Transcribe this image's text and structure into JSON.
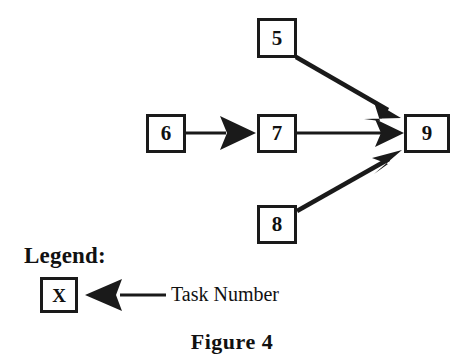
{
  "figure": {
    "caption": "Figure  4",
    "background_color": "#ffffff",
    "ink_color": "#1a1a1a"
  },
  "diagram": {
    "nodes": [
      {
        "id": "node-5",
        "label": "5",
        "x": 257,
        "y": 18,
        "w": 40,
        "h": 40
      },
      {
        "id": "node-6",
        "label": "6",
        "x": 146,
        "y": 114,
        "w": 40,
        "h": 39
      },
      {
        "id": "node-7",
        "label": "7",
        "x": 257,
        "y": 114,
        "w": 40,
        "h": 39
      },
      {
        "id": "node-8",
        "label": "8",
        "x": 257,
        "y": 205,
        "w": 40,
        "h": 39
      },
      {
        "id": "node-9",
        "label": "9",
        "x": 404,
        "y": 114,
        "w": 46,
        "h": 39
      }
    ],
    "edges": [
      {
        "id": "edge-5-9",
        "from": "5",
        "to": "9",
        "x1": 296,
        "y1": 57,
        "x2": 400,
        "y2": 117
      },
      {
        "id": "edge-6-7",
        "from": "6",
        "to": "7",
        "x1": 186,
        "y1": 133,
        "x2": 256,
        "y2": 133
      },
      {
        "id": "edge-7-9",
        "from": "7",
        "to": "9",
        "x1": 297,
        "y1": 133,
        "x2": 403,
        "y2": 133
      },
      {
        "id": "edge-8-9",
        "from": "8",
        "to": "9",
        "x1": 297,
        "y1": 211,
        "x2": 401,
        "y2": 152
      }
    ]
  },
  "legend": {
    "title": "Legend:",
    "sample_box_label": "X",
    "sample_box": {
      "x": 40,
      "y": 277,
      "w": 38,
      "h": 36
    },
    "pointer_caption": "Task Number",
    "pointer": {
      "tip_x": 85,
      "tail_x": 166,
      "y": 295
    }
  }
}
